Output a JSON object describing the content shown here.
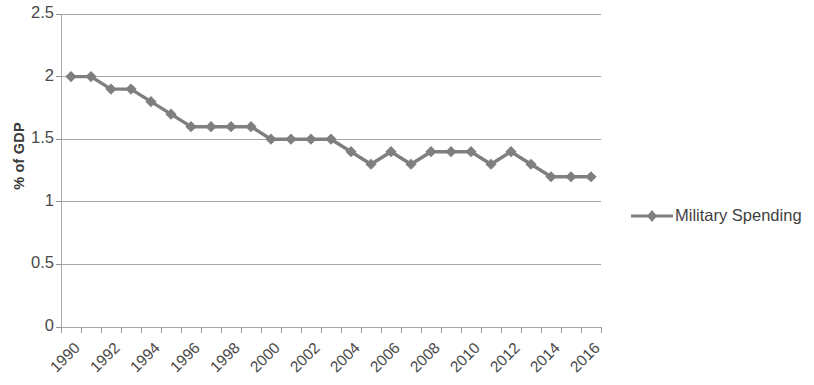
{
  "chart_data": {
    "type": "line",
    "title": "",
    "xlabel": "",
    "ylabel": "% of GDP",
    "ylim": [
      0,
      2.5
    ],
    "ytick_values": [
      0,
      0.5,
      1,
      1.5,
      2,
      2.5
    ],
    "ytick_labels": [
      "0",
      "0.5",
      "1",
      "1.5",
      "2",
      "2.5"
    ],
    "xlim": [
      1990,
      2016
    ],
    "xtick_labels": [
      "1990",
      "1992",
      "1994",
      "1996",
      "1998",
      "2000",
      "2002",
      "2004",
      "2006",
      "2008",
      "2010",
      "2012",
      "2014",
      "2016"
    ],
    "grid": true,
    "grid_axis": "y",
    "legend_position": "right",
    "series": [
      {
        "name": "Military Spending",
        "color": "#7f7f7f",
        "marker": "diamond",
        "x": [
          1990,
          1991,
          1992,
          1993,
          1994,
          1995,
          1996,
          1997,
          1998,
          1999,
          2000,
          2001,
          2002,
          2003,
          2004,
          2005,
          2006,
          2007,
          2008,
          2009,
          2010,
          2011,
          2012,
          2013,
          2014,
          2015,
          2016
        ],
        "values": [
          2.0,
          2.0,
          1.9,
          1.9,
          1.8,
          1.7,
          1.6,
          1.6,
          1.6,
          1.6,
          1.5,
          1.5,
          1.5,
          1.5,
          1.4,
          1.3,
          1.4,
          1.3,
          1.4,
          1.4,
          1.4,
          1.3,
          1.4,
          1.3,
          1.2,
          1.2,
          1.2
        ]
      }
    ]
  },
  "legend": {
    "entries": [
      {
        "label": "Military Spending",
        "color": "#7f7f7f"
      }
    ]
  },
  "axes": {
    "y_title": "% of GDP"
  }
}
